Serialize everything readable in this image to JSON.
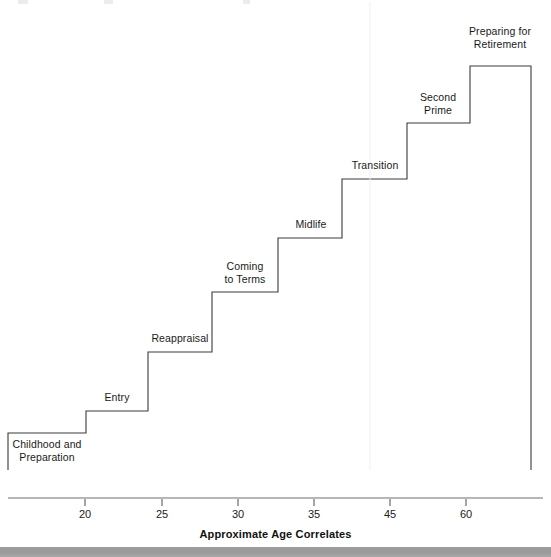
{
  "figure": {
    "title_fragment_visible": "",
    "axis_title": "Approximate Age Correlates",
    "axis_ticks": [
      {
        "label": "20",
        "x": 85
      },
      {
        "label": "25",
        "x": 162
      },
      {
        "label": "30",
        "x": 238
      },
      {
        "label": "35",
        "x": 314
      },
      {
        "label": "45",
        "x": 390
      },
      {
        "label": "60",
        "x": 466
      }
    ],
    "steps": [
      {
        "label": "Childhood and\nPreparation",
        "left": 8,
        "right": 86,
        "top": 433,
        "bottom": 470,
        "label_cx": 47,
        "label_y": 438
      },
      {
        "label": "Entry",
        "left": 86,
        "right": 148,
        "top": 411,
        "bottom": 470,
        "label_cx": 117,
        "label_y": 391
      },
      {
        "label": "Reappraisal",
        "left": 148,
        "right": 212,
        "top": 352,
        "bottom": 470,
        "label_cx": 180,
        "label_y": 332
      },
      {
        "label": "Coming\nto Terms",
        "left": 212,
        "right": 278,
        "top": 292,
        "bottom": 470,
        "label_cx": 245,
        "label_y": 260
      },
      {
        "label": "Midlife",
        "left": 278,
        "right": 342,
        "top": 238,
        "bottom": 470,
        "label_cx": 311,
        "label_y": 218
      },
      {
        "label": "Transition",
        "left": 342,
        "right": 407,
        "top": 179,
        "bottom": 470,
        "label_cx": 375,
        "label_y": 159
      },
      {
        "label": "Second\nPrime",
        "left": 407,
        "right": 470,
        "top": 123,
        "bottom": 470,
        "label_cx": 438,
        "label_y": 91
      },
      {
        "label": "Preparing for\nRetirement",
        "left": 470,
        "right": 531,
        "top": 66,
        "bottom": 470,
        "label_cx": 500,
        "label_y": 25
      }
    ],
    "colors": {
      "line": "#3a3a3a",
      "axis": "#4a4a4a",
      "text": "#1a1a1a",
      "bottom_bar": "#9d9d9d"
    }
  },
  "chart_data": {
    "type": "line",
    "title": "",
    "xlabel": "Approximate Age Correlates",
    "ylabel": "",
    "xtick_labels": [
      "20",
      "25",
      "30",
      "35",
      "45",
      "60"
    ],
    "xtick_pixels": [
      85,
      162,
      238,
      314,
      390,
      466
    ],
    "grid": false,
    "legend": "none",
    "categories": [
      "Childhood and Preparation",
      "Entry",
      "Reappraisal",
      "Coming to Terms",
      "Midlife",
      "Transition",
      "Second Prime",
      "Preparing for Retirement"
    ],
    "age_ranges": [
      {
        "stage": "Childhood and Preparation",
        "age_start": null,
        "age_end": 20
      },
      {
        "stage": "Entry",
        "age_start": 20,
        "age_end": 25
      },
      {
        "stage": "Reappraisal",
        "age_start": 25,
        "age_end": 30
      },
      {
        "stage": "Coming to Terms",
        "age_start": 30,
        "age_end": 35
      },
      {
        "stage": "Midlife",
        "age_start": 35,
        "age_end": 40
      },
      {
        "stage": "Transition",
        "age_start": 40,
        "age_end": 45
      },
      {
        "stage": "Second Prime",
        "age_start": 45,
        "age_end": 60
      },
      {
        "stage": "Preparing for Retirement",
        "age_start": 60,
        "age_end": null
      }
    ],
    "values": [
      1,
      2,
      3,
      4,
      5,
      6,
      7,
      8
    ],
    "note": "Monotonic ascending staircase; each tread is one career/life stage plotted against approximate age."
  }
}
